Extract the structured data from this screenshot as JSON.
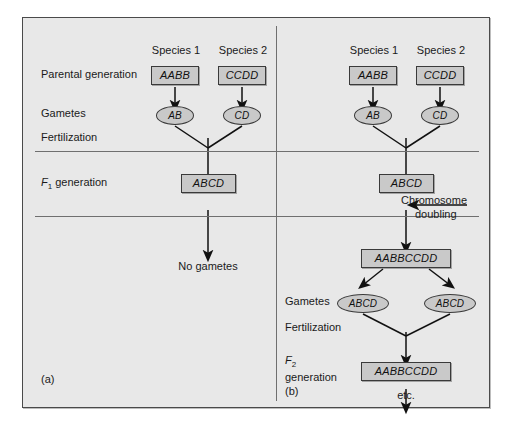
{
  "figure": {
    "background_color": "#e8e8e8",
    "node_fill_color": "#c9c9c9",
    "node_border_color": "#3a3a3a",
    "rule_color": "#6f6f6f"
  },
  "panel_a": {
    "tag": "(a)",
    "column_headers": [
      "Species 1",
      "Species 2"
    ],
    "row_labels": {
      "parental": "Parental generation",
      "gametes": "Gametes",
      "fertilization": "Fertilization",
      "f1_prefix": "F",
      "f1_sub": "1",
      "f1_suffix": " generation"
    },
    "parents": [
      "AABB",
      "CCDD"
    ],
    "gametes": [
      "AB",
      "CD"
    ],
    "hybrid": "ABCD",
    "outcome": "No gametes"
  },
  "panel_b": {
    "tag": "(b)",
    "column_headers": [
      "Species 1",
      "Species 2"
    ],
    "row_labels": {
      "gametes": "Gametes",
      "fertilization": "Fertilization",
      "f2_prefix": "F",
      "f2_sub": "2",
      "f2_suffix": "generation"
    },
    "parents": [
      "AABB",
      "CCDD"
    ],
    "gametes": [
      "AB",
      "CD"
    ],
    "hybrid": "ABCD",
    "annotation": {
      "line1": "Chromosome",
      "line2": "doubling"
    },
    "doubled": "AABBCCDD",
    "gametes_second": [
      "ABCD",
      "ABCD"
    ],
    "f2_zygote": "AABBCCDD",
    "outcome": "etc."
  }
}
